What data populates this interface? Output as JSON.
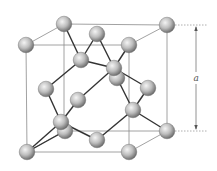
{
  "diagram": {
    "dimension_label": "a",
    "colors": {
      "atom_light": "#f2f2f2",
      "atom_mid": "#b8b8b8",
      "atom_dark": "#6e6e6e",
      "bond": "#333333",
      "cube_edge": "#8a8a8a"
    },
    "cube": {
      "back": [
        [
          64,
          24
        ],
        [
          167,
          25
        ],
        [
          167,
          131
        ],
        [
          64,
          131
        ]
      ],
      "front": [
        [
          26,
          45
        ],
        [
          129,
          45
        ],
        [
          129,
          152
        ],
        [
          27,
          152
        ]
      ]
    },
    "atoms": [
      {
        "id": "corner-back-top-left",
        "x": 64,
        "y": 24
      },
      {
        "id": "corner-back-top-right",
        "x": 167,
        "y": 25
      },
      {
        "id": "face-top",
        "x": 97,
        "y": 34
      },
      {
        "id": "corner-front-top-left",
        "x": 26,
        "y": 45
      },
      {
        "id": "corner-front-top-right",
        "x": 129,
        "y": 45
      },
      {
        "id": "interior-1",
        "x": 81,
        "y": 60
      },
      {
        "id": "face-back",
        "x": 117,
        "y": 78
      },
      {
        "id": "interior-2",
        "x": 114,
        "y": 68
      },
      {
        "id": "face-left",
        "x": 46,
        "y": 89
      },
      {
        "id": "face-right",
        "x": 148,
        "y": 88
      },
      {
        "id": "face-front",
        "x": 78,
        "y": 100
      },
      {
        "id": "interior-4",
        "x": 133,
        "y": 110
      },
      {
        "id": "corner-back-bottom-left",
        "x": 65,
        "y": 131
      },
      {
        "id": "interior-3",
        "x": 61,
        "y": 122
      },
      {
        "id": "corner-back-bottom-right",
        "x": 167,
        "y": 131
      },
      {
        "id": "face-bottom",
        "x": 97,
        "y": 140
      },
      {
        "id": "corner-front-bottom-left",
        "x": 27,
        "y": 152
      },
      {
        "id": "corner-front-bottom-right",
        "x": 129,
        "y": 152
      }
    ],
    "bonds": [
      [
        64,
        24,
        81,
        60
      ],
      [
        97,
        34,
        81,
        60
      ],
      [
        81,
        60,
        46,
        89
      ],
      [
        81,
        60,
        114,
        68
      ],
      [
        129,
        45,
        114,
        68
      ],
      [
        97,
        34,
        114,
        68
      ],
      [
        114,
        68,
        78,
        100
      ],
      [
        114,
        68,
        148,
        88
      ],
      [
        117,
        78,
        133,
        110
      ],
      [
        148,
        88,
        133,
        110
      ],
      [
        133,
        110,
        167,
        131
      ],
      [
        133,
        110,
        97,
        140
      ],
      [
        46,
        89,
        61,
        122
      ],
      [
        78,
        100,
        61,
        122
      ],
      [
        61,
        122,
        27,
        152
      ],
      [
        61,
        122,
        97,
        140
      ],
      [
        65,
        131,
        27,
        152
      ]
    ]
  }
}
